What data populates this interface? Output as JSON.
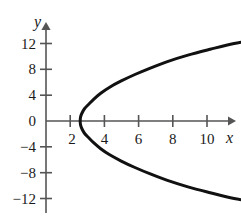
{
  "chart_data": {
    "type": "line",
    "title": "",
    "subtitle": "",
    "xlabel": "x",
    "ylabel": "y",
    "xlim": [
      -0.8,
      13.4
    ],
    "ylim": [
      -15.0,
      14.5
    ],
    "grid": false,
    "legend": null,
    "annotations": [],
    "axes": {
      "x_axis_color": "#555555",
      "y_axis_color": "#555555",
      "x_arrow": true,
      "y_arrow": true,
      "origin_label": "0"
    },
    "x_ticks": [
      {
        "value": 2,
        "label": "2"
      },
      {
        "value": 4,
        "label": "4"
      },
      {
        "value": 6,
        "label": "6"
      },
      {
        "value": 8,
        "label": "8"
      },
      {
        "value": 10,
        "label": "10"
      }
    ],
    "y_ticks": [
      {
        "value": 12,
        "label": "12"
      },
      {
        "value": 8,
        "label": "8"
      },
      {
        "value": 4,
        "label": "4"
      },
      {
        "value": 0,
        "label": "0"
      },
      {
        "value": -4,
        "label": "−4"
      },
      {
        "value": -8,
        "label": "−8"
      },
      {
        "value": -12,
        "label": "−12"
      }
    ],
    "series": [
      {
        "name": "sideways parabola",
        "equation": "x = 2 + y^2/17.4",
        "color": "#111111",
        "line_width": 3,
        "vertex": [
          2,
          0
        ],
        "opens": "right",
        "points": [
          [
            12.52,
            12.7
          ],
          [
            11.0,
            12.0
          ],
          [
            9.6,
            11.1
          ],
          [
            8.3,
            10.2
          ],
          [
            7.1,
            9.2
          ],
          [
            6.1,
            8.2
          ],
          [
            5.2,
            7.2
          ],
          [
            4.4,
            6.2
          ],
          [
            3.7,
            5.2
          ],
          [
            3.2,
            4.3
          ],
          [
            2.8,
            3.4
          ],
          [
            2.5,
            2.6
          ],
          [
            2.25,
            1.9
          ],
          [
            2.1,
            1.2
          ],
          [
            2.02,
            0.6
          ],
          [
            2.0,
            0.0
          ],
          [
            2.02,
            -0.6
          ],
          [
            2.1,
            -1.2
          ],
          [
            2.25,
            -1.9
          ],
          [
            2.5,
            -2.6
          ],
          [
            2.8,
            -3.4
          ],
          [
            3.2,
            -4.3
          ],
          [
            3.7,
            -5.2
          ],
          [
            4.4,
            -6.2
          ],
          [
            5.2,
            -7.2
          ],
          [
            6.1,
            -8.2
          ],
          [
            7.1,
            -9.2
          ],
          [
            8.3,
            -10.2
          ],
          [
            9.6,
            -11.1
          ],
          [
            11.0,
            -12.0
          ],
          [
            12.52,
            -12.7
          ]
        ]
      }
    ]
  }
}
